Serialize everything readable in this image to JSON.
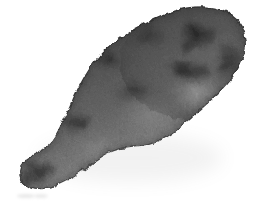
{
  "image": {
    "kind": "photograph",
    "subject": "sweet-potato-tuber",
    "subject_label": "Sweet potato tuber",
    "color_mode": "grayscale",
    "background_color": "#ffffff",
    "canvas": {
      "width": 257,
      "height": 208
    },
    "orientation": "diagonal, thick end upper-right, tapered tail lower-left",
    "palette": {
      "background": "#ffffff",
      "body_mid": "#6e6e6e",
      "body_light": "#a8a8a8",
      "body_highlight": "#c6c6c6",
      "body_dark": "#3a3a3a",
      "body_darkest": "#1d1d1d",
      "edge_shadow": "#4a4a4a",
      "smudge": "#c9c9c9"
    },
    "subject_bbox": {
      "x": 18,
      "y": 6,
      "width": 230,
      "height": 185
    },
    "features": [
      {
        "name": "bulbous-head",
        "region": "upper-right",
        "tone": "mid-dark"
      },
      {
        "name": "dark-blotch-upper-right",
        "cx": 196,
        "cy": 38,
        "tone": "darkest"
      },
      {
        "name": "dark-blotch-mid-right",
        "cx": 190,
        "cy": 72,
        "tone": "darkest"
      },
      {
        "name": "light-patch-lower-right",
        "cx": 196,
        "cy": 90,
        "tone": "highlight"
      },
      {
        "name": "dark-patch-left-shoulder",
        "cx": 108,
        "cy": 62,
        "tone": "dark"
      },
      {
        "name": "waist-notch",
        "cx": 128,
        "cy": 150,
        "tone": "background"
      },
      {
        "name": "tapered-tail-tip",
        "cx": 34,
        "cy": 170,
        "tone": "dark"
      }
    ],
    "texture": {
      "type": "fibrous-granular",
      "fiber_direction": "diagonal, parallel to long axis",
      "grain_density": "high"
    },
    "annotations": {
      "corner_smudge_text": "",
      "corner_smudge_present": true
    }
  }
}
